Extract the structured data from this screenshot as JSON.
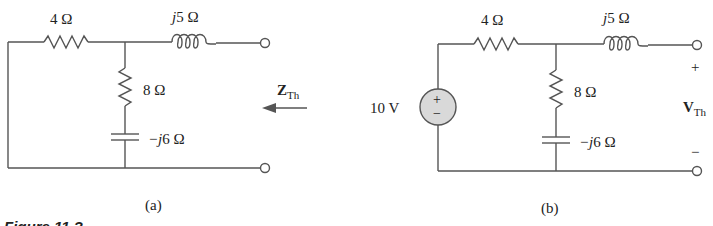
{
  "figure": {
    "caption_partial": "Figure 11.?",
    "panels": [
      {
        "id": "a",
        "label": "(a)",
        "components": {
          "series_resistor": "4 Ω",
          "inductor_prefix": "j",
          "inductor_value": "5 Ω",
          "shunt_resistor": "8 Ω",
          "capacitor_prefix": "−j",
          "capacitor_value": "6 Ω"
        },
        "output": {
          "symbol": "Z",
          "subscript": "Th",
          "arrow": "left-arrow"
        }
      },
      {
        "id": "b",
        "label": "(b)",
        "components": {
          "source": "10 V",
          "source_plus": "+",
          "source_minus": "−",
          "series_resistor": "4 Ω",
          "inductor_prefix": "j",
          "inductor_value": "5 Ω",
          "shunt_resistor": "8 Ω",
          "capacitor_prefix": "−j",
          "capacitor_value": "6 Ω"
        },
        "output": {
          "symbol": "V",
          "subscript": "Th",
          "plus": "+",
          "minus": "−"
        }
      }
    ]
  },
  "colors": {
    "wire": "#555555",
    "source_fill": "#d9d9d9",
    "text": "#222222"
  }
}
